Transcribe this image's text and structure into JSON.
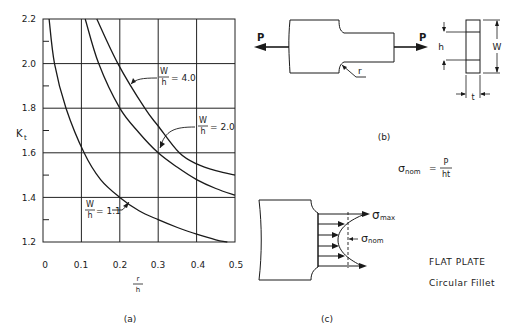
{
  "chart_data": {
    "type": "line",
    "xlabel": "r/h",
    "ylabel": "Kt",
    "xlim": [
      0,
      0.5
    ],
    "ylim": [
      1.2,
      2.2
    ],
    "grid": true,
    "x_ticks": [
      "0",
      "0.1",
      "0.2",
      "0.3",
      "0.4",
      "0.5"
    ],
    "y_ticks": [
      "1.2",
      "1.4",
      "1.6",
      "1.8",
      "2.0",
      "2.2"
    ],
    "series": [
      {
        "name": "W/h = 1.1",
        "label_num": "W",
        "label_den": "h",
        "label_val": "= 1.1",
        "points": [
          [
            0.016,
            2.2
          ],
          [
            0.03,
            2.0
          ],
          [
            0.06,
            1.8
          ],
          [
            0.107,
            1.6
          ],
          [
            0.15,
            1.48
          ],
          [
            0.2,
            1.4
          ],
          [
            0.25,
            1.34
          ],
          [
            0.3,
            1.3
          ],
          [
            0.35,
            1.265
          ],
          [
            0.4,
            1.235
          ],
          [
            0.45,
            1.21
          ],
          [
            0.48,
            1.2
          ]
        ]
      },
      {
        "name": "W/h = 2.0",
        "label_num": "W",
        "label_den": "h",
        "label_val": "= 2.0",
        "points": [
          [
            0.11,
            2.2
          ],
          [
            0.145,
            2.0
          ],
          [
            0.2,
            1.8
          ],
          [
            0.25,
            1.69
          ],
          [
            0.3,
            1.6
          ],
          [
            0.35,
            1.535
          ],
          [
            0.4,
            1.48
          ],
          [
            0.45,
            1.44
          ],
          [
            0.5,
            1.41
          ]
        ]
      },
      {
        "name": "W/h = 4.0",
        "label_num": "W",
        "label_den": "h",
        "label_val": "= 4.0",
        "points": [
          [
            0.14,
            2.2
          ],
          [
            0.195,
            2.0
          ],
          [
            0.265,
            1.8
          ],
          [
            0.3,
            1.72
          ],
          [
            0.355,
            1.6
          ],
          [
            0.4,
            1.55
          ],
          [
            0.45,
            1.52
          ],
          [
            0.5,
            1.5
          ]
        ]
      }
    ],
    "panel_label": "(a)"
  },
  "diagram_b": {
    "load_left": "P",
    "load_right": "P",
    "fillet_label": "r",
    "dim_h": "h",
    "dim_w": "W",
    "dim_t": "t",
    "panel_label": "(b)"
  },
  "formula": {
    "lhs_symbol": "σ",
    "lhs_sub": "nom",
    "equals": "=",
    "numerator": "P",
    "denominator": "ht"
  },
  "diagram_c": {
    "max_symbol": "σ",
    "max_sub": "max",
    "nom_symbol": "σ",
    "nom_sub": "nom",
    "panel_label": "(c)"
  },
  "caption": {
    "line1": "FLAT PLATE",
    "line2": "Circular Fillet"
  }
}
